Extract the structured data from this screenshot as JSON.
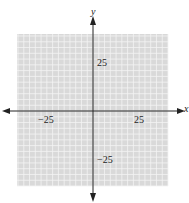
{
  "chart_data": {
    "type": "scatter",
    "title": "",
    "xlabel": "x",
    "ylabel": "y",
    "xlim": [
      -65,
      65
    ],
    "ylim": [
      -65,
      65
    ],
    "grid": true,
    "grid_step": 5,
    "x_ticks": [
      -25,
      25
    ],
    "y_ticks": [
      25,
      -25
    ],
    "tick_labels": {
      "x_neg": "−25",
      "x_pos": "25",
      "y_pos": "25",
      "y_neg": "−25"
    },
    "series": []
  },
  "colors": {
    "grid_bg": "#d9d9d9",
    "grid_line": "#f4f4f4",
    "axis": "#222222"
  }
}
